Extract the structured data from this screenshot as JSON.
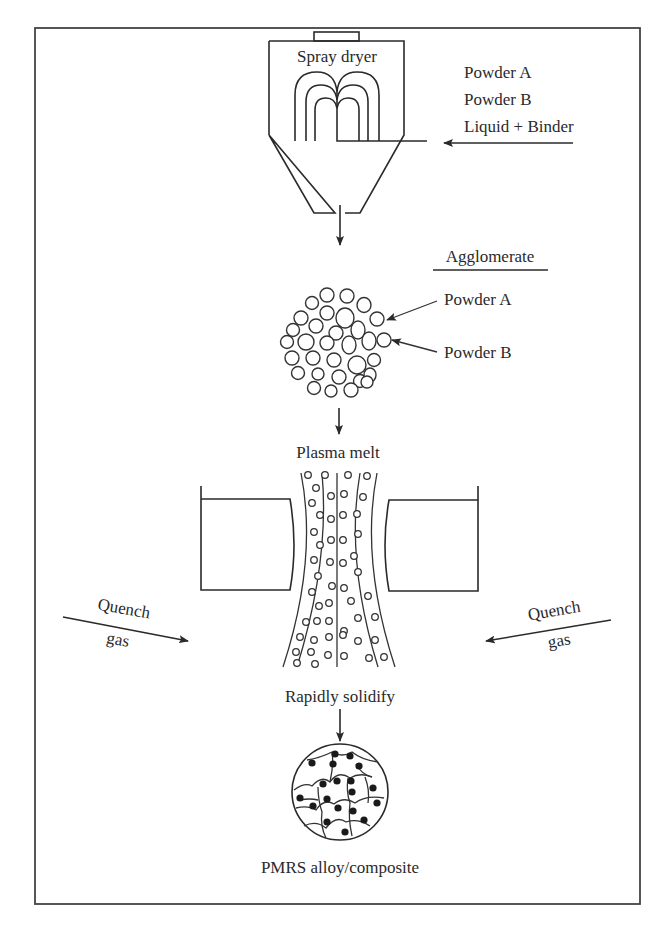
{
  "figure": {
    "stages": {
      "spray_dryer": {
        "label": "Spray dryer",
        "inputs": [
          "Powder A",
          "Powder B",
          "Liquid + Binder"
        ]
      },
      "agglomerate": {
        "label": "Agglomerate",
        "callouts": [
          "Powder A",
          "Powder B"
        ]
      },
      "plasma": {
        "label": "Plasma melt",
        "quench_left": {
          "line1": "Quench",
          "line2": "gas"
        },
        "quench_right": {
          "line1": "Quench",
          "line2": "gas"
        }
      },
      "solidify": {
        "label": "Rapidly solidify"
      },
      "product": {
        "label": "PMRS alloy/composite"
      }
    },
    "colors": {
      "line": "#2a2a2a",
      "background": "#ffffff"
    }
  }
}
